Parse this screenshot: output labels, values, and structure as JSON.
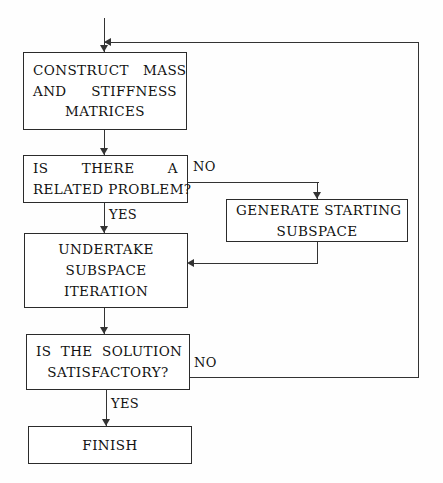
{
  "diagram": {
    "background_color": "#fefefe",
    "line_color": "#333333",
    "text_color": "#111111"
  },
  "nodes": {
    "construct": {
      "id": "construct-matrices",
      "shape": "rectangle",
      "lines": [
        "CONSTRUCT   MASS",
        "AND     STIFFNESS",
        "MATRICES"
      ]
    },
    "related_problem": {
      "id": "is-there-a-related-problem",
      "shape": "rectangle-decision",
      "lines": [
        "IS    THERE    A",
        "RELATED PROBLEM?"
      ]
    },
    "generate": {
      "id": "generate-starting-subspace",
      "shape": "rectangle",
      "lines": [
        "GENERATE STARTING",
        "SUBSPACE"
      ]
    },
    "undertake": {
      "id": "undertake-subspace-iteration",
      "shape": "rectangle",
      "lines": [
        "UNDERTAKE",
        "SUBSPACE",
        "ITERATION"
      ]
    },
    "satisfactory": {
      "id": "is-the-solution-satisfactory",
      "shape": "rectangle-decision",
      "lines": [
        "IS  THE  SOLUTION",
        "SATISFACTORY?"
      ]
    },
    "finish": {
      "id": "finish",
      "shape": "rectangle",
      "lines": [
        "FINISH"
      ]
    }
  },
  "edge_labels": {
    "no_related": "NO",
    "yes_related": "YES",
    "no_satisfactory": "NO",
    "yes_satisfactory": "YES"
  },
  "flow": {
    "edges": [
      {
        "from": "entry",
        "to": "construct",
        "label": ""
      },
      {
        "from": "construct",
        "to": "related_problem",
        "label": ""
      },
      {
        "from": "related_problem",
        "to": "generate",
        "label": "NO"
      },
      {
        "from": "related_problem",
        "to": "undertake",
        "label": "YES"
      },
      {
        "from": "generate",
        "to": "undertake",
        "label": ""
      },
      {
        "from": "undertake",
        "to": "satisfactory",
        "label": ""
      },
      {
        "from": "satisfactory",
        "to": "construct",
        "label": "NO"
      },
      {
        "from": "satisfactory",
        "to": "finish",
        "label": "YES"
      }
    ]
  }
}
